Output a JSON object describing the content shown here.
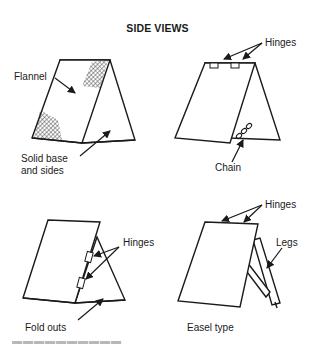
{
  "title": "SIDE VIEWS",
  "panels": [
    {
      "id": "solid",
      "labels": {
        "flannel": "Flannel",
        "base_line1": "Solid base",
        "base_line2": "and sides"
      }
    },
    {
      "id": "chain",
      "labels": {
        "hinges": "Hinges",
        "chain": "Chain"
      }
    },
    {
      "id": "foldouts",
      "labels": {
        "hinges": "Hinges",
        "caption": "Fold outs"
      }
    },
    {
      "id": "easel",
      "labels": {
        "hinges": "Hinges",
        "legs": "Legs",
        "caption": "Easel type"
      }
    }
  ],
  "colors": {
    "ink": "#1a1a1a",
    "background": "#ffffff"
  }
}
